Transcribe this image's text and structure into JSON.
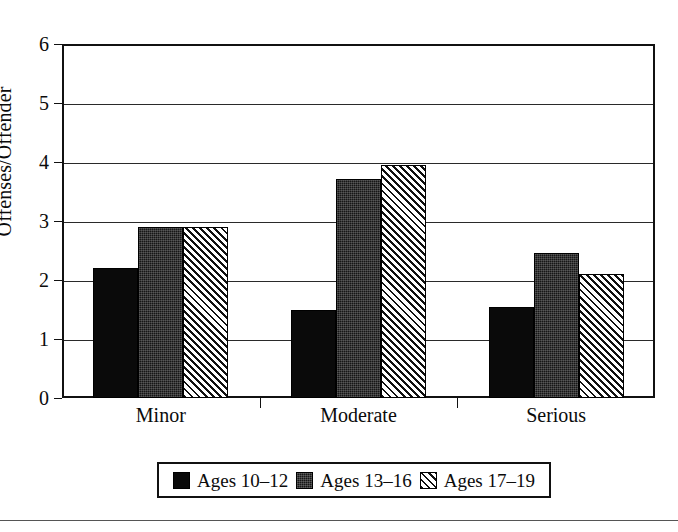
{
  "chart_data": {
    "type": "bar",
    "title": "",
    "subtitle": "",
    "xlabel": "",
    "ylabel": "Offenses/Offender",
    "categories": [
      "Minor",
      "Moderate",
      "Serious"
    ],
    "series": [
      {
        "name": "Ages 10–12",
        "pattern": "solid-black",
        "values": [
          2.2,
          1.5,
          1.55
        ]
      },
      {
        "name": "Ages 13–16",
        "pattern": "dense-dark-texture",
        "values": [
          2.9,
          3.72,
          2.45
        ]
      },
      {
        "name": "Ages 17–19",
        "pattern": "diagonal-hatch",
        "values": [
          2.9,
          3.95,
          2.1
        ]
      }
    ],
    "ylim": [
      0,
      6
    ],
    "ytick_values": [
      0,
      1,
      2,
      3,
      4,
      5,
      6
    ],
    "ytick_labels": [
      "0",
      "1",
      "2",
      "3",
      "4",
      "5",
      "6"
    ],
    "grid": true,
    "grid_axis": "y",
    "legend_position": "bottom-center",
    "legend_entries": [
      "Ages 10–12",
      "Ages 13–16",
      "Ages 17–19"
    ],
    "colors": {
      "series_1": "#0a0a0a",
      "series_2": "#161616",
      "series_3": "#101010",
      "background": "#ffffff",
      "axis": "#111111",
      "gridline": "#2a2a2a"
    }
  }
}
